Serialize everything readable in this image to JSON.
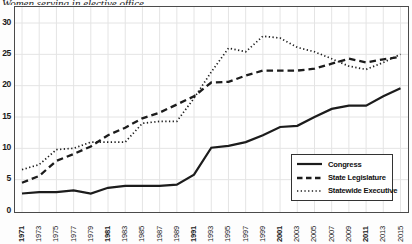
{
  "figure": {
    "cropped_top_text": "Women serving in elective office",
    "background_color": "#fdfdfd",
    "line_color": "#1c1c1c",
    "grid_color": "#e4e4e4"
  },
  "legend": {
    "position": "right-middle"
  },
  "chart_data": {
    "type": "line",
    "title": "",
    "xlabel": "",
    "ylabel": "",
    "x": [
      1971,
      1973,
      1975,
      1977,
      1979,
      1981,
      1983,
      1985,
      1987,
      1989,
      1991,
      1993,
      1995,
      1997,
      1999,
      2001,
      2003,
      2005,
      2007,
      2009,
      2011,
      2013,
      2015
    ],
    "x_bold_ticks": [
      1971,
      1981,
      1991,
      2001,
      2011
    ],
    "ylim": [
      0,
      30
    ],
    "y_ticks": [
      0,
      5,
      10,
      15,
      20,
      25,
      30
    ],
    "grid": true,
    "series": [
      {
        "name": "Congress",
        "style": "solid",
        "values": [
          2.8,
          3.0,
          3.0,
          3.3,
          2.8,
          3.7,
          4.0,
          4.0,
          4.0,
          4.2,
          5.8,
          10.1,
          10.4,
          11.0,
          12.1,
          13.4,
          13.6,
          15.0,
          16.3,
          16.8,
          16.8,
          18.3,
          19.6
        ]
      },
      {
        "name": "State Legislature",
        "style": "dashed",
        "values": [
          4.5,
          5.6,
          8.0,
          9.1,
          10.3,
          12.1,
          13.3,
          14.8,
          15.7,
          17.0,
          18.3,
          20.5,
          20.6,
          21.6,
          22.4,
          22.4,
          22.4,
          22.7,
          23.5,
          24.3,
          23.7,
          24.2,
          24.6
        ]
      },
      {
        "name": "Statewide Executive",
        "style": "dotted",
        "values": [
          6.6,
          7.4,
          9.8,
          10.0,
          11.0,
          11.0,
          11.0,
          14.0,
          14.3,
          14.3,
          18.0,
          22.2,
          26.0,
          25.4,
          27.9,
          27.6,
          26.1,
          25.4,
          24.3,
          23.1,
          22.6,
          23.7,
          25.0
        ]
      }
    ]
  }
}
